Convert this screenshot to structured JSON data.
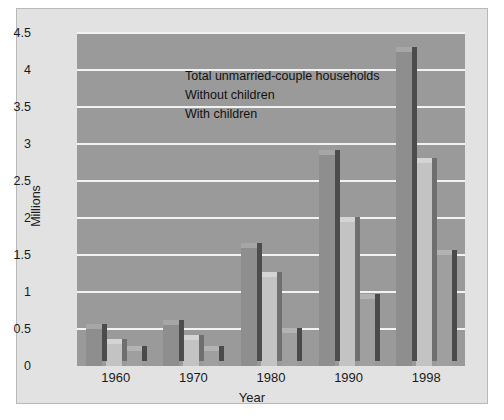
{
  "chart_data": {
    "type": "bar",
    "title": "",
    "xlabel": "Year",
    "ylabel": "Millions",
    "categories": [
      "1960",
      "1970",
      "1980",
      "1990",
      "1998"
    ],
    "series": [
      {
        "name": "Total unmarried-couple households",
        "values": [
          0.5,
          0.55,
          1.6,
          2.85,
          4.25
        ],
        "color": "#8e8e8e"
      },
      {
        "name": "Without children",
        "values": [
          0.3,
          0.35,
          1.2,
          1.95,
          2.75
        ],
        "color": "#c3c3c3"
      },
      {
        "name": "With children",
        "values": [
          0.2,
          0.2,
          0.45,
          0.9,
          1.5
        ],
        "color": "#9f9f9f"
      }
    ],
    "ylim": [
      0,
      4.5
    ],
    "yticks": [
      "0",
      "0.5",
      "1",
      "1.5",
      "2",
      "2.5",
      "3",
      "3.5",
      "4",
      "4.5"
    ],
    "ytick_values": [
      0,
      0.5,
      1,
      1.5,
      2,
      2.5,
      3,
      3.5,
      4,
      4.5
    ],
    "grid": true,
    "legend_position": "top-left",
    "plot_background": "#9a9a9a",
    "figure_background": "#e2e2e2",
    "gridline_color": "#f2f2f2"
  }
}
